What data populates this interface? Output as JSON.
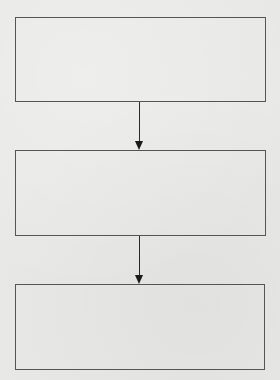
{
  "diagram": {
    "type": "flowchart",
    "direction": "top-to-bottom",
    "nodes": [
      {
        "id": "step-1",
        "label": ""
      },
      {
        "id": "step-2",
        "label": ""
      },
      {
        "id": "step-3",
        "label": ""
      }
    ],
    "edges": [
      {
        "from": "step-1",
        "to": "step-2"
      },
      {
        "from": "step-2",
        "to": "step-3"
      }
    ],
    "colors": {
      "stroke": "#555555",
      "arrow": "#1a1a1a",
      "background": "#e8e8e6"
    }
  }
}
